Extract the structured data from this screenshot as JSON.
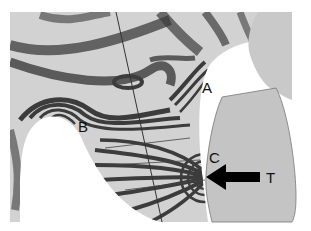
{
  "figure": {
    "labels": {
      "A": "A",
      "B": "B",
      "C": "C",
      "T": "T"
    },
    "colors": {
      "background": "#ffffff",
      "gear_body": "#c8c8c8",
      "fringe_dark": "#3a3a3a",
      "fringe_light": "#d6d6d6",
      "arrow": "#000000"
    }
  }
}
